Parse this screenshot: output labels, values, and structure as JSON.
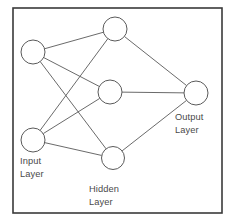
{
  "diagram": {
    "background_color": "#ffffff",
    "frame": {
      "x": 13,
      "y": 8,
      "width": 209,
      "height": 205,
      "stroke_color": "#3a3a3a"
    },
    "node_style": {
      "radius": 12,
      "fill_color": "#ffffff",
      "stroke_color": "#5a5a5a"
    },
    "edge_style": {
      "stroke_color": "#595959"
    },
    "labels": [
      {
        "name": "input-layer-label",
        "line1": "Input",
        "line2": "Layer",
        "x": 20,
        "y": 164
      },
      {
        "name": "hidden-layer-label",
        "line1": "Hidden",
        "line2": "Layer",
        "x": 89,
        "y": 192
      },
      {
        "name": "output-layer-label",
        "line1": "Output",
        "line2": "Layer",
        "x": 175,
        "y": 120
      }
    ],
    "nodes": [
      {
        "id": "i1",
        "layer": "input",
        "cx": 33,
        "cy": 52,
        "r": 12
      },
      {
        "id": "i2",
        "layer": "input",
        "cx": 33,
        "cy": 140,
        "r": 12
      },
      {
        "id": "h1",
        "layer": "hidden",
        "cx": 115,
        "cy": 29,
        "r": 12
      },
      {
        "id": "h2",
        "layer": "hidden",
        "cx": 110,
        "cy": 92,
        "r": 12
      },
      {
        "id": "h3",
        "layer": "hidden",
        "cx": 113,
        "cy": 158,
        "r": 11.5
      },
      {
        "id": "o1",
        "layer": "output",
        "cx": 196,
        "cy": 93,
        "r": 12
      }
    ],
    "edges": [
      {
        "from": "i1",
        "to": "h1"
      },
      {
        "from": "i1",
        "to": "h2"
      },
      {
        "from": "i1",
        "to": "h3"
      },
      {
        "from": "i2",
        "to": "h1"
      },
      {
        "from": "i2",
        "to": "h2"
      },
      {
        "from": "i2",
        "to": "h3"
      },
      {
        "from": "h1",
        "to": "o1"
      },
      {
        "from": "h2",
        "to": "o1"
      },
      {
        "from": "h3",
        "to": "o1"
      }
    ]
  }
}
